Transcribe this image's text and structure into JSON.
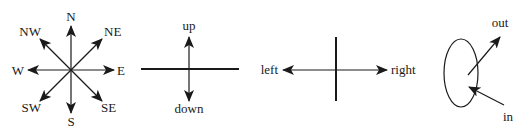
{
  "diagram": {
    "compass": {
      "labels": {
        "n": "N",
        "ne": "NE",
        "e": "E",
        "se": "SE",
        "s": "S",
        "sw": "SW",
        "w": "W",
        "nw": "NW"
      }
    },
    "vertical": {
      "up": "up",
      "down": "down"
    },
    "horizontal": {
      "left": "left",
      "right": "right"
    },
    "depth": {
      "out": "out",
      "in": "in"
    },
    "colors": {
      "ink": "#1a1a1a",
      "background": "#ffffff"
    }
  }
}
